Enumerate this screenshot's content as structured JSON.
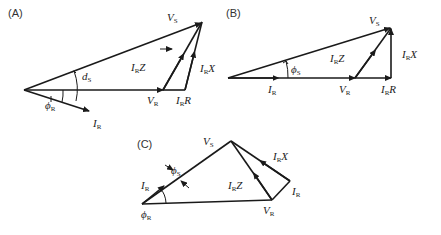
{
  "figure": {
    "panels": [
      {
        "id": "A",
        "label": "(A)",
        "labels": {
          "vs": {
            "main": "V",
            "sub": "S"
          },
          "irz": {
            "main": "I",
            "sub": "R",
            "tail": "Z"
          },
          "irx": {
            "main": "I",
            "sub": "R",
            "tail": "X"
          },
          "ds": {
            "main": "d",
            "sub": "S"
          },
          "phir": {
            "main": "ϕ",
            "sub": "R"
          },
          "vr": {
            "main": "V",
            "sub": "R"
          },
          "irr": {
            "main": "I",
            "sub": "R",
            "tail": "R"
          },
          "ir": {
            "main": "I",
            "sub": "R"
          }
        }
      },
      {
        "id": "B",
        "label": "(B)",
        "labels": {
          "vs": {
            "main": "V",
            "sub": "S"
          },
          "phis": {
            "main": "ϕ",
            "sub": "S"
          },
          "irz": {
            "main": "I",
            "sub": "R",
            "tail": "Z"
          },
          "irx": {
            "main": "I",
            "sub": "R",
            "tail": "X"
          },
          "ir": {
            "main": "I",
            "sub": "R"
          },
          "vr": {
            "main": "V",
            "sub": "R"
          },
          "irr": {
            "main": "I",
            "sub": "R",
            "tail": "R"
          }
        }
      },
      {
        "id": "C",
        "label": "(C)",
        "labels": {
          "vs": {
            "main": "V",
            "sub": "S"
          },
          "phis": {
            "main": "ϕ",
            "sub": "S"
          },
          "irx": {
            "main": "I",
            "sub": "R",
            "tail": "X"
          },
          "ir_left": {
            "main": "I",
            "sub": "R"
          },
          "irz": {
            "main": "I",
            "sub": "R",
            "tail": "Z"
          },
          "ir_right": {
            "main": "I",
            "sub": "R"
          },
          "phir": {
            "main": "ϕ",
            "sub": "R"
          },
          "vr": {
            "main": "V",
            "sub": "R"
          }
        }
      }
    ]
  }
}
